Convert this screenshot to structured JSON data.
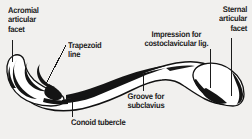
{
  "figure": {
    "view": "inferior view of right clavicle",
    "background_color": "#f1f0ee",
    "ink_color": "#1b1b1b",
    "width": 252,
    "height": 139
  },
  "labels": {
    "acromial": "Acromial\narticular\nfacet",
    "sternal": "Sternal\narticular\nfacet",
    "trapezoid": "Trapezoid\nline",
    "costoclavicular": "Impression for\ncostoclavicular lig.",
    "groove": "Groove for\nsubclavius",
    "conoid": "Conoid tubercle"
  }
}
